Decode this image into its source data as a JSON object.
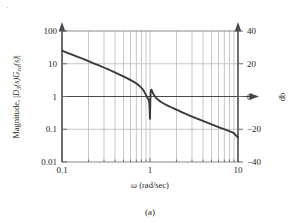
{
  "figure": {
    "caption": "(a)",
    "corner_mark": "·"
  },
  "chart_data": {
    "type": "line",
    "title": "",
    "xlabel": "ω (rad/sec)",
    "ylabel": "Magnitude,  |D₃(s)Gᴄᴏ(s)|",
    "ylabel_parts": {
      "prefix": "Magnitude,  |",
      "d_sym": "D",
      "d_sub": "3",
      "d_arg": "(s)",
      "g_sym": "G",
      "g_sub": "co",
      "g_arg": "(s)|"
    },
    "ylabel_right": "db",
    "xscale": "log",
    "yscale": "log",
    "xlim": [
      0.1,
      10
    ],
    "ylim": [
      0.01,
      100
    ],
    "xticks": [
      0.1,
      1,
      10
    ],
    "xtick_labels": [
      "0.1",
      "1",
      "10"
    ],
    "yticks": [
      0.01,
      0.1,
      1,
      10,
      100
    ],
    "ytick_labels": [
      "0.01",
      "0.1",
      "1",
      "10",
      "100"
    ],
    "right_axis": {
      "label": "db",
      "ticks_db": [
        -40,
        -20,
        0,
        20,
        40
      ],
      "tick_labels": [
        "−40",
        "−20",
        "0",
        "20",
        "40"
      ],
      "lim_db": [
        -40,
        40
      ]
    },
    "grid": {
      "vertical": "log-minor",
      "horizontal": "decades",
      "on": true
    },
    "legend": null,
    "annotations": [
      {
        "text": "0 db axis arrow",
        "y": 1.0,
        "style": "arrow-right"
      }
    ],
    "series": [
      {
        "name": "|D3(s)Gco(s)|",
        "color": "#3a3a3a",
        "points": [
          [
            0.1,
            25.0
          ],
          [
            0.115,
            21.6
          ],
          [
            0.132,
            18.7
          ],
          [
            0.151,
            16.2
          ],
          [
            0.174,
            14.0
          ],
          [
            0.2,
            12.0
          ],
          [
            0.229,
            10.3
          ],
          [
            0.263,
            8.85
          ],
          [
            0.302,
            7.55
          ],
          [
            0.347,
            6.45
          ],
          [
            0.398,
            5.45
          ],
          [
            0.457,
            4.6
          ],
          [
            0.525,
            3.85
          ],
          [
            0.603,
            3.18
          ],
          [
            0.661,
            2.76
          ],
          [
            0.724,
            2.34
          ],
          [
            0.776,
            2.0
          ],
          [
            0.813,
            1.75
          ],
          [
            0.841,
            1.55
          ],
          [
            0.865,
            1.36
          ],
          [
            0.891,
            1.18
          ],
          [
            0.912,
            1.04
          ],
          [
            0.933,
            0.93
          ],
          [
            0.955,
            0.84
          ],
          [
            0.966,
            0.78
          ],
          [
            0.977,
            0.7
          ],
          [
            0.983,
            0.6
          ],
          [
            0.988,
            0.48
          ],
          [
            0.992,
            0.36
          ],
          [
            0.995,
            0.27
          ],
          [
            0.998,
            0.22
          ],
          [
            1.0,
            0.21
          ],
          [
            1.003,
            0.32
          ],
          [
            1.007,
            0.6
          ],
          [
            1.012,
            1.0
          ],
          [
            1.018,
            1.35
          ],
          [
            1.026,
            1.55
          ],
          [
            1.035,
            1.62
          ],
          [
            1.047,
            1.55
          ],
          [
            1.072,
            1.33
          ],
          [
            1.1,
            1.15
          ],
          [
            1.148,
            0.97
          ],
          [
            1.202,
            0.85
          ],
          [
            1.259,
            0.76
          ],
          [
            1.349,
            0.67
          ],
          [
            1.445,
            0.6
          ],
          [
            1.585,
            0.53
          ],
          [
            1.738,
            0.47
          ],
          [
            1.905,
            0.42
          ],
          [
            2.089,
            0.375
          ],
          [
            2.291,
            0.335
          ],
          [
            2.512,
            0.3
          ],
          [
            2.818,
            0.262
          ],
          [
            3.162,
            0.23
          ],
          [
            3.548,
            0.203
          ],
          [
            3.981,
            0.18
          ],
          [
            4.467,
            0.159
          ],
          [
            5.012,
            0.141
          ],
          [
            5.623,
            0.125
          ],
          [
            6.31,
            0.111
          ],
          [
            7.079,
            0.0985
          ],
          [
            7.943,
            0.087
          ],
          [
            8.913,
            0.077
          ],
          [
            10.0,
            0.056
          ]
        ]
      }
    ]
  }
}
